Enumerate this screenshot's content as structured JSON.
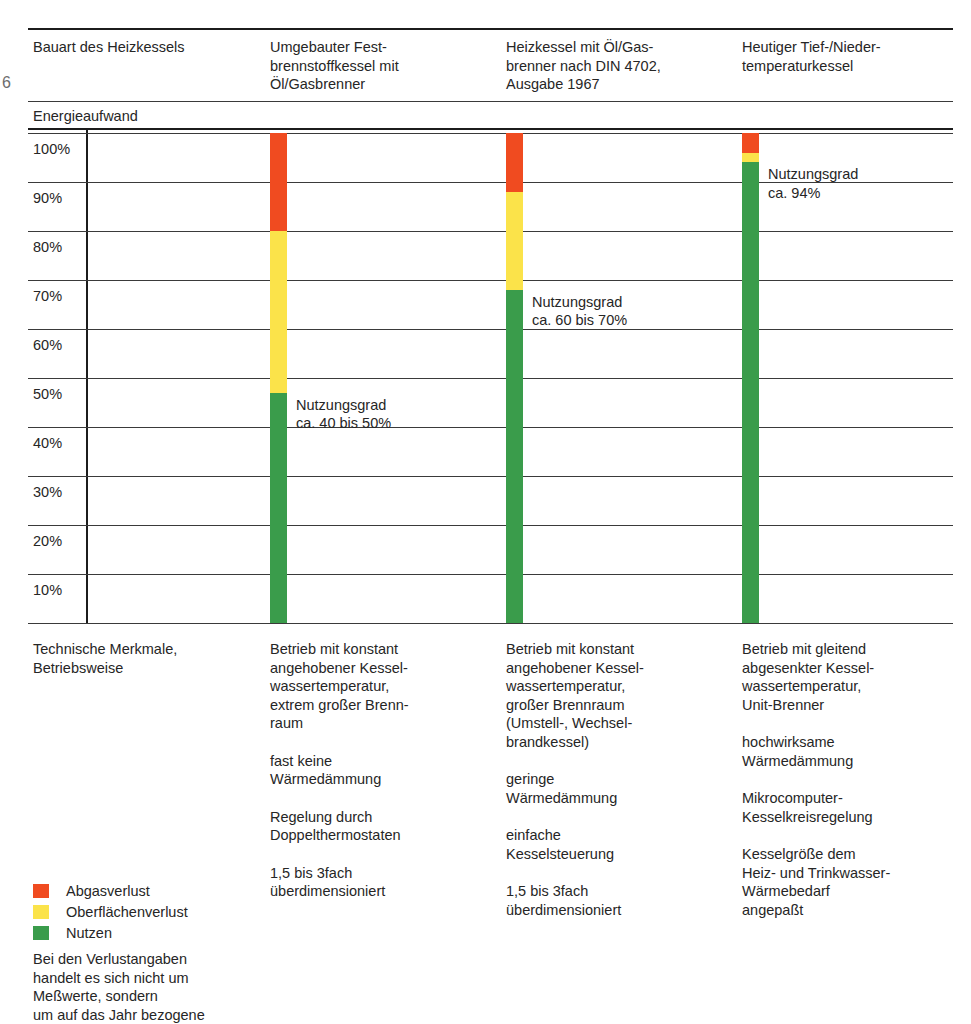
{
  "stray_glyph": "6",
  "header": {
    "row_label": "Bauart des Heizkessels",
    "columns": [
      "Umgebauter Fest-\nbrennstoffkessel mit\nÖl/Gasbrenner",
      "Heizkessel mit Öl/Gas-\nbrenner nach DIN 4702,\nAusgabe 1967",
      "Heutiger Tief-/Nieder-\ntemperaturkessel"
    ]
  },
  "section_label": "Energieaufwand",
  "chart_data": {
    "type": "bar",
    "title": "Energieaufwand",
    "xlabel": "",
    "ylabel": "",
    "ylim": [
      0,
      100
    ],
    "grid": true,
    "legend_position": "bottom-left",
    "ytick_labels": [
      "100%",
      "90%",
      "80%",
      "70%",
      "60%",
      "50%",
      "40%",
      "30%",
      "20%",
      "10%"
    ],
    "ytick_values": [
      100,
      90,
      80,
      70,
      60,
      50,
      40,
      30,
      20,
      10
    ],
    "categories": [
      "Umgebauter Festbrennstoffkessel mit Öl/Gasbrenner",
      "Heizkessel mit Öl/Gasbrenner nach DIN 4702, Ausgabe 1967",
      "Heutiger Tief-/Niedertemperaturkessel"
    ],
    "series": [
      {
        "name": "Nutzen",
        "color": "#3a9c4b",
        "values": [
          47,
          68,
          94
        ]
      },
      {
        "name": "Oberflächenverlust",
        "color": "#fbe34a",
        "values": [
          33,
          20,
          2
        ]
      },
      {
        "name": "Abgasverlust",
        "color": "#f04b20",
        "values": [
          20,
          12,
          4
        ]
      }
    ],
    "annotations": [
      {
        "text": "Nutzungsgrad\nca. 40 bis 50%",
        "at_series": "Nutzen",
        "at_category": 0,
        "at_value": 47
      },
      {
        "text": "Nutzungsgrad\nca. 60 bis 70%",
        "at_series": "Nutzen",
        "at_category": 1,
        "at_value": 68
      },
      {
        "text": "Nutzungsgrad\nca. 94%",
        "at_series": "Nutzen",
        "at_category": 2,
        "at_value": 94
      }
    ]
  },
  "lower": {
    "row_label": "Technische Merkmale,\nBetriebsweise",
    "columns": [
      [
        "Betrieb mit konstant\nangehobener Kessel-\nwassertemperatur,\nextrem großer Brenn-\nraum",
        "fast keine\nWärmedämmung",
        "Regelung durch\nDoppelthermostaten",
        "1,5 bis 3fach\nüberdimensioniert"
      ],
      [
        "Betrieb mit konstant\nangehobener Kessel-\nwassertemperatur,\ngroßer Brennraum\n(Umstell-, Wechsel-\nbrandkessel)",
        "geringe\nWärmedämmung",
        "einfache\nKesselsteuerung",
        "1,5 bis 3fach\nüberdimensioniert"
      ],
      [
        "Betrieb mit gleitend\nabgesenkter Kessel-\nwassertemperatur,\nUnit-Brenner",
        "hochwirksame\nWärmedämmung",
        "Mikrocomputer-\nKesselkreisregelung",
        "Kesselgröße dem\nHeiz- und Trinkwasser-\nWärmebedarf\nangepaßt"
      ]
    ]
  },
  "legend": {
    "items": [
      {
        "label": "Abgasverlust",
        "color": "#f04b20"
      },
      {
        "label": "Oberflächenverlust",
        "color": "#fbe34a"
      },
      {
        "label": "Nutzen",
        "color": "#3a9c4b"
      }
    ],
    "note": "Bei den Verlustangaben\nhandelt es sich nicht um\nMeßwerte, sondern\num auf das Jahr bezogene"
  }
}
